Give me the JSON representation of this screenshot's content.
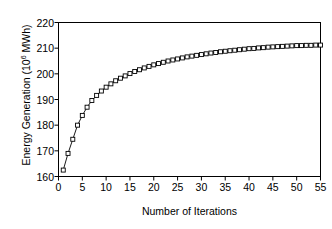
{
  "chart_data": {
    "type": "line",
    "title": "",
    "subtitle": "",
    "xlabel": "Number of Iterations",
    "ylabel": "Energy Generation (10⁶ MWh)",
    "ylabel_text": "Energy Generation (10",
    "ylabel_sup": "6",
    "ylabel_tail": " MWh)",
    "xlim": [
      0,
      55
    ],
    "ylim": [
      160,
      220
    ],
    "xticks": [
      0,
      5,
      10,
      15,
      20,
      25,
      30,
      35,
      40,
      45,
      50,
      55
    ],
    "yticks": [
      160,
      170,
      180,
      190,
      200,
      210,
      220
    ],
    "xtick_labels": [
      "0",
      "5",
      "10",
      "15",
      "20",
      "25",
      "30",
      "35",
      "40",
      "45",
      "50",
      "55"
    ],
    "ytick_labels": [
      "160",
      "170",
      "180",
      "190",
      "200",
      "210",
      "220"
    ],
    "grid": false,
    "legend": false,
    "legend_position": "none",
    "marker": "open-square",
    "marker_size": 4,
    "line_color": "#000000",
    "marker_fill": "#ffffff",
    "marker_edge": "#000000",
    "axis_color": "#000000",
    "background": "#ffffff",
    "series": [
      {
        "name": "Energy Generation",
        "x": [
          1,
          2,
          3,
          4,
          5,
          6,
          7,
          8,
          9,
          10,
          11,
          12,
          13,
          14,
          15,
          16,
          17,
          18,
          19,
          20,
          21,
          22,
          23,
          24,
          25,
          26,
          27,
          28,
          29,
          30,
          31,
          32,
          33,
          34,
          35,
          36,
          37,
          38,
          39,
          40,
          41,
          42,
          43,
          44,
          45,
          46,
          47,
          48,
          49,
          50,
          51,
          52,
          53,
          54,
          55
        ],
        "values": [
          162.5,
          169.0,
          174.5,
          180.0,
          183.8,
          187.0,
          189.6,
          191.6,
          193.3,
          194.8,
          196.1,
          197.3,
          198.3,
          199.2,
          200.1,
          200.9,
          201.6,
          202.3,
          202.9,
          203.5,
          204.0,
          204.5,
          205.0,
          205.4,
          205.8,
          206.2,
          206.6,
          206.9,
          207.2,
          207.5,
          207.8,
          208.1,
          208.3,
          208.6,
          208.8,
          209.0,
          209.2,
          209.4,
          209.6,
          209.8,
          209.9,
          210.1,
          210.2,
          210.4,
          210.5,
          210.6,
          210.7,
          210.8,
          210.9,
          211.0,
          211.0,
          211.1,
          211.1,
          211.2,
          211.2
        ]
      }
    ]
  }
}
